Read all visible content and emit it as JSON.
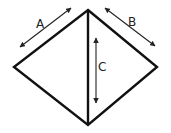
{
  "diagram": {
    "labels": {
      "a": "A",
      "b": "B",
      "c": "C"
    },
    "colors": {
      "stroke": "#111111",
      "arrow": "#222222",
      "background": "#ffffff"
    }
  }
}
